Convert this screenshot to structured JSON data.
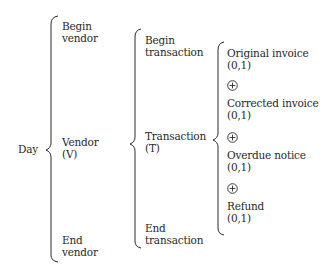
{
  "diagram": {
    "root": {
      "label": "Day"
    },
    "level1": {
      "items": [
        {
          "line1": "Begin",
          "line2": "vendor"
        },
        {
          "line1": "Vendor",
          "line2": "(V)"
        },
        {
          "line1": "End",
          "line2": "vendor"
        }
      ]
    },
    "level2": {
      "items": [
        {
          "line1": "Begin",
          "line2": "transaction"
        },
        {
          "line1": "Transaction",
          "line2": "(T)"
        },
        {
          "line1": "End",
          "line2": "transaction"
        }
      ]
    },
    "level3": {
      "items": [
        {
          "label": "Original invoice",
          "cardinality": "(0,1)"
        },
        {
          "label": "Corrected invoice",
          "cardinality": "(0,1)"
        },
        {
          "label": "Overdue notice",
          "cardinality": "(0,1)"
        },
        {
          "label": "Refund",
          "cardinality": "(0,1)"
        }
      ],
      "separator_symbol": "exclusive-or-circled-plus"
    },
    "colors": {
      "ink": "#2a2a2a",
      "background": "#ffffff"
    }
  }
}
